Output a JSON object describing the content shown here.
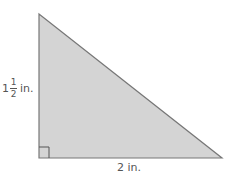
{
  "figure": {
    "shape": "right-triangle",
    "fill_color": "#d4d4d4",
    "stroke_color": "#777777",
    "right_angle_marker": true
  },
  "labels": {
    "height": {
      "whole": "1",
      "numerator": "1",
      "denominator": "2",
      "unit": "in."
    },
    "base": "2 in."
  }
}
